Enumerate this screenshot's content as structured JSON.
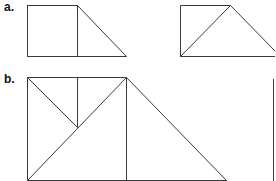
{
  "labels": {
    "a": "a.",
    "b": "b."
  },
  "colors": {
    "stroke": "#3a3a3a",
    "background": "#ffffff"
  },
  "figures": {
    "a_left": {
      "square": {
        "x": 27,
        "y": 5,
        "w": 50,
        "h": 51
      },
      "triangle": [
        [
          77,
          5
        ],
        [
          126,
          56
        ],
        [
          77,
          56
        ]
      ]
    },
    "a_right": {
      "rect_left": 180,
      "top": 5,
      "bottom": 56,
      "peak": [
        230,
        5
      ],
      "right_x": 276
    },
    "b": {
      "top": 77,
      "bottom": 180,
      "left": 27,
      "mid_x": 77,
      "right_x": 126,
      "inner_meet": [
        77,
        127
      ],
      "slope_end_x": 226
    },
    "b_partial": {
      "x": 273,
      "top": 79,
      "bottom": 181
    }
  }
}
